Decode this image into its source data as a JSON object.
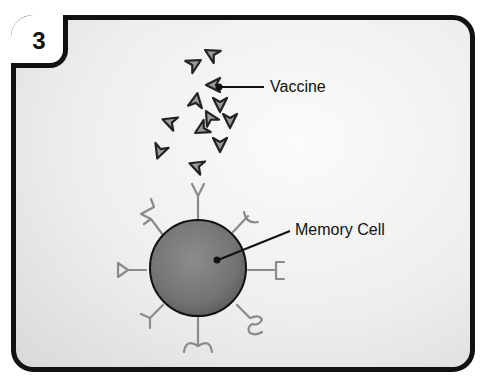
{
  "panel": {
    "step_number": "3",
    "border_color": "#111111",
    "background_color": "#eeeeee"
  },
  "labels": {
    "vaccine": "Vaccine",
    "memory_cell": "Memory Cell"
  },
  "colors": {
    "cell_fill": "#7a7a7a",
    "cell_outline": "#111111",
    "receptor_stroke": "#8a8a8a",
    "vaccine_fill": "#9a9a9a",
    "vaccine_outline": "#222222"
  },
  "diagram": {
    "vaccine_particle_count": 13,
    "memory_cell_receptor_count": 8
  }
}
